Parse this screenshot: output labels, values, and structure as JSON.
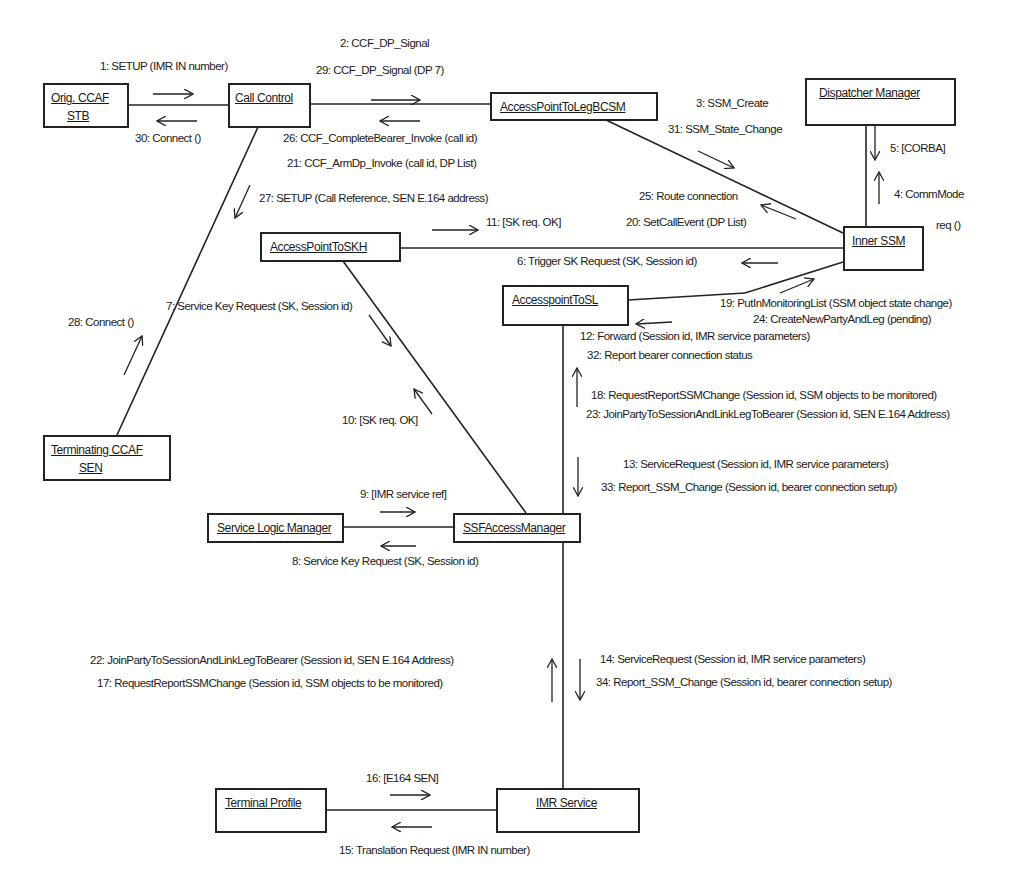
{
  "objects": {
    "orig_ccaf": {
      "line1": "Orig. CCAF",
      "line2": "STB"
    },
    "call_control": {
      "label": "Call Control"
    },
    "access_point_to_leg_bcsm": {
      "label": "AccessPointToLegBCSM"
    },
    "dispatcher_manager": {
      "label": "Dispatcher Manager"
    },
    "inner_ssm": {
      "label": "Inner SSM"
    },
    "access_point_to_skh": {
      "label": "AccessPointToSKH"
    },
    "access_point_to_sl": {
      "label": "AccesspointToSL"
    },
    "terminating_ccaf": {
      "line1": "Terminating CCAF",
      "line2": "SEN"
    },
    "service_logic_manager": {
      "label": "Service Logic Manager"
    },
    "ssf_access_manager": {
      "label": "SSFAccessManager"
    },
    "terminal_profile": {
      "label": "Terminal Profile"
    },
    "imr_service": {
      "label": "IMR Service"
    }
  },
  "messages": {
    "m1": "1: SETUP (IMR IN number)",
    "m2": "2: CCF_DP_Signal",
    "m3": "3: SSM_Create",
    "m4a": "4: CommMode",
    "m4b": "req ()",
    "m5": "5: [CORBA]",
    "m6": "6: Trigger SK Request (SK, Session id)",
    "m7": "7: Service Key Request (SK, Session id)",
    "m8": "8: Service Key Request  (SK, Session id)",
    "m9": "9: [IMR service ref]",
    "m10": "10: [SK req. OK]",
    "m11": "11: [SK req. OK]",
    "m12": "12: Forward (Session id, IMR service parameters)",
    "m13": "13:  ServiceRequest (Session id, IMR service parameters)",
    "m14": "14:  ServiceRequest (Session id, IMR service parameters)",
    "m15": "15: Translation Request (IMR IN number)",
    "m16": "16: [E164 SEN]",
    "m17": "17:  RequestReportSSMChange (Session id, SSM objects to be monitored)",
    "m18": "18:  RequestReportSSMChange (Session id, SSM objects to be monitored)",
    "m19": "19:  PutInMonitoringList (SSM object state change)",
    "m20": "20:  SetCallEvent (DP List)",
    "m21": "21:  CCF_ArmDp_Invoke (call id, DP List)",
    "m22": "22:  JoinPartyToSessionAndLinkLegToBearer (Session id, SEN E.164 Address)",
    "m23": "23:  JoinPartyToSessionAndLinkLegToBearer (Session id, SEN E.164 Address)",
    "m24": "24:  CreateNewPartyAndLeg (pending)",
    "m25": "25: Route connection",
    "m26": "26:  CCF_CompleteBearer_Invoke (call id)",
    "m27": "27: SETUP (Call Reference, SEN E.164 address)",
    "m28": "28: Connect ()",
    "m29": "29:  CCF_DP_Signal (DP 7)",
    "m30": "30: Connect ()",
    "m31": "31:  SSM_State_Change",
    "m32": "32: Report bearer connection status",
    "m33": "33:  Report_SSM_Change (Session id, bearer connection setup)",
    "m34": "34:  Report_SSM_Change (Session id, bearer connection setup)"
  }
}
